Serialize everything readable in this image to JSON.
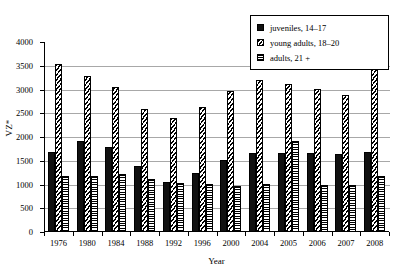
{
  "chart_data": {
    "type": "bar",
    "title": "",
    "subtitle": "",
    "xlabel": "Year",
    "ylabel": "VZ*",
    "ylim": [
      0,
      4000
    ],
    "yticks": [
      0,
      500,
      1000,
      1500,
      2000,
      2500,
      3000,
      3500,
      4000
    ],
    "ytick_labels": [
      "0",
      "500",
      "1000",
      "1500",
      "2000",
      "2500",
      "3000",
      "3500",
      "4000"
    ],
    "grid": true,
    "legend_position": "top-right",
    "categories": [
      "1976",
      "1980",
      "1984",
      "1988",
      "1992",
      "1996",
      "2000",
      "2004",
      "2005",
      "2006",
      "2007",
      "2008"
    ],
    "series": [
      {
        "name": "juveniles, 14–17",
        "pattern": "solid-black",
        "values": [
          1680,
          1920,
          1800,
          1390,
          1050,
          1250,
          1520,
          1670,
          1660,
          1660,
          1640,
          1690
        ]
      },
      {
        "name": "young adults, 18–20",
        "pattern": "diagonal-hatch",
        "values": [
          3530,
          3290,
          3050,
          2600,
          2410,
          2640,
          2960,
          3210,
          3120,
          3010,
          2880,
          3540
        ]
      },
      {
        "name": "adults, 21 +",
        "pattern": "horizontal-hatch",
        "values": [
          1180,
          1170,
          1220,
          1120,
          1040,
          1010,
          960,
          1010,
          1910,
          980,
          1000,
          1180
        ]
      }
    ]
  },
  "legend": {
    "items": [
      {
        "label": "juveniles, 14–17"
      },
      {
        "label": "young adults, 18–20"
      },
      {
        "label": "adults, 21 +"
      }
    ]
  },
  "axes": {
    "y_title": "VZ*",
    "x_title": "Year"
  }
}
